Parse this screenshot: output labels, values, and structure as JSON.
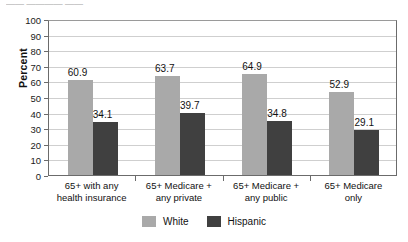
{
  "top_fragment": "——  ————  ——",
  "axis": {
    "ylabel": "Percent",
    "yticks": [
      "100",
      "90",
      "80",
      "70",
      "60",
      "50",
      "40",
      "30",
      "20",
      "10",
      "0"
    ]
  },
  "legend": {
    "items": [
      {
        "label": "White",
        "color": "#a9a9a9"
      },
      {
        "label": "Hispanic",
        "color": "#404040"
      }
    ]
  },
  "categories": [
    {
      "line1": "65+ with any",
      "line2": "health insurance"
    },
    {
      "line1": "65+ Medicare +",
      "line2": "any private"
    },
    {
      "line1": "65+ Medicare +",
      "line2": "any public"
    },
    {
      "line1": "65+ Medicare",
      "line2": "only"
    }
  ],
  "bar_labels": {
    "g0_white": "60.9",
    "g0_hisp": "34.1",
    "g1_white": "63.7",
    "g1_hisp": "39.7",
    "g2_white": "64.9",
    "g2_hisp": "34.8",
    "g3_white": "52.9",
    "g3_hisp": "29.1"
  },
  "chart_data": {
    "type": "bar",
    "title": "",
    "xlabel": "",
    "ylabel": "Percent",
    "ylim": [
      0,
      100
    ],
    "ytick_step": 10,
    "grid": true,
    "legend_position": "bottom-center",
    "categories": [
      "65+ with any health insurance",
      "65+ Medicare + any private",
      "65+ Medicare + any public",
      "65+ Medicare only"
    ],
    "series": [
      {
        "name": "White",
        "color": "#a9a9a9",
        "values": [
          60.9,
          63.7,
          64.9,
          52.9
        ]
      },
      {
        "name": "Hispanic",
        "color": "#404040",
        "values": [
          34.1,
          39.7,
          34.8,
          29.1
        ]
      }
    ]
  }
}
